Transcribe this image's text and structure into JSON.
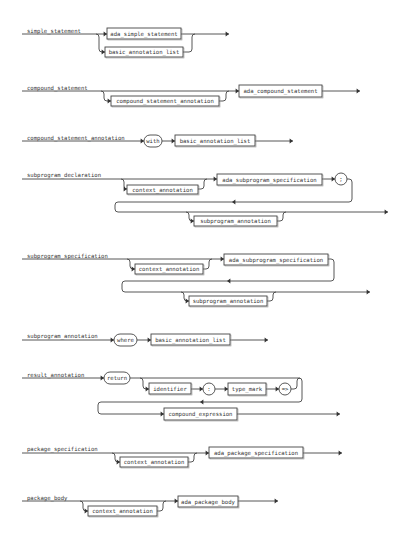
{
  "diagrams": [
    {
      "name": "simple_statement",
      "label": {
        "text": "simple_statement",
        "x": 27,
        "y": 29
      },
      "lines": [
        "M22,34 L96,34",
        "M96,34 L107,34",
        "M96,34 Q99,34 99,37 L99,49 Q99,52 102,52 L105,52",
        "M181,34 L229,34",
        "M183,52 L189,52 Q192,52 192,49 L192,37 Q192,34 195,34"
      ],
      "arrows": [
        {
          "x": 107,
          "y": 34,
          "dir": "right"
        },
        {
          "x": 105,
          "y": 52,
          "dir": "right"
        },
        {
          "x": 229,
          "y": 34,
          "dir": "right"
        }
      ],
      "nodes": [
        {
          "type": "box",
          "text": "ada_simple_statement",
          "x": 107,
          "y": 28,
          "w": 74,
          "h": 11
        },
        {
          "type": "box",
          "text": "basic_annotation_list",
          "x": 105,
          "y": 47,
          "w": 78,
          "h": 10
        }
      ]
    },
    {
      "name": "compound_statement",
      "label": {
        "text": "compound_statement",
        "x": 27,
        "y": 86
      },
      "lines": [
        "M22,91 L239,91",
        "M101,91 Q104,91 104,94 L104,98 Q104,101 107,101 L111,101",
        "M219,101 L223,101 Q226,101 226,98 L226,94 Q226,91 229,91",
        "M322,91 L360,91"
      ],
      "arrows": [
        {
          "x": 111,
          "y": 101,
          "dir": "right"
        },
        {
          "x": 239,
          "y": 91,
          "dir": "right"
        },
        {
          "x": 360,
          "y": 91,
          "dir": "right"
        }
      ],
      "nodes": [
        {
          "type": "box",
          "text": "compound_statement_annotation",
          "x": 111,
          "y": 96,
          "w": 108,
          "h": 10
        },
        {
          "type": "box",
          "text": "ada_compound_statement",
          "x": 239,
          "y": 85,
          "w": 83,
          "h": 12
        }
      ]
    },
    {
      "name": "compound_statement_annotation",
      "label": {
        "text": "compound_statement_annotation",
        "x": 27,
        "y": 136
      },
      "lines": [
        "M22,141 L144,141",
        "M162,141 L175,141",
        "M255,141 L293,141"
      ],
      "arrows": [
        {
          "x": 144,
          "y": 141,
          "dir": "right"
        },
        {
          "x": 175,
          "y": 141,
          "dir": "right"
        },
        {
          "x": 293,
          "y": 141,
          "dir": "right"
        }
      ],
      "nodes": [
        {
          "type": "pill",
          "text": "with",
          "x": 144,
          "y": 135,
          "w": 18,
          "h": 12
        },
        {
          "type": "box",
          "text": "basic_annotation_list",
          "x": 175,
          "y": 135,
          "w": 80,
          "h": 11
        }
      ]
    },
    {
      "name": "subprogram_declaration",
      "label": {
        "text": "subprogram_declaration",
        "x": 27,
        "y": 173
      },
      "lines": [
        "M22,179 L217,179",
        "M121,179 Q124,179 124,182 L124,186 Q124,189 127,189",
        "M198,189 L201,189 Q204,189 204,186 L204,182 Q204,179 207,179",
        "M322,179 L335,179",
        "M347,179 L349,179 Q352,179 352,182 L352,199 Q352,202 349,202 L118,202 Q115,202 115,205 L115,209 Q115,212 118,212 L388,212",
        "M186,212 Q189,212 189,215 L189,218 Q189,221 192,221 L194,221",
        "M277,221 L280,221 Q283,221 283,218 L283,215 Q283,212 286,212"
      ],
      "arrows": [
        {
          "x": 127,
          "y": 189,
          "dir": "right"
        },
        {
          "x": 217,
          "y": 179,
          "dir": "right"
        },
        {
          "x": 335,
          "y": 179,
          "dir": "right"
        },
        {
          "x": 232,
          "y": 202,
          "dir": "left"
        },
        {
          "x": 194,
          "y": 221,
          "dir": "right"
        },
        {
          "x": 388,
          "y": 212,
          "dir": "right"
        }
      ],
      "nodes": [
        {
          "type": "box",
          "text": "context_annotation",
          "x": 127,
          "y": 185,
          "w": 71,
          "h": 9
        },
        {
          "type": "box",
          "text": "ada_subprogram_specification",
          "x": 217,
          "y": 174,
          "w": 105,
          "h": 11
        },
        {
          "type": "circle",
          "text": ";",
          "x": 341,
          "y": 179,
          "r": 6
        },
        {
          "type": "box",
          "text": "subprogram_annotation",
          "x": 194,
          "y": 216,
          "w": 83,
          "h": 10
        }
      ]
    },
    {
      "name": "subprogram_specification",
      "label": {
        "text": "subprogram_specification",
        "x": 27,
        "y": 254
      },
      "lines": [
        "M22,259 L224,259",
        "M127,259 Q130,259 130,262 L130,266 Q130,269 133,269 L135,269",
        "M203,269 L206,269 Q209,269 209,266 L209,262 Q209,259 212,259",
        "M328,259 L331,259 Q334,259 334,262 L334,278 Q334,281 331,281 L125,281 Q122,281 122,284 L122,289 Q122,292 125,292 L370,292",
        "M181,292 Q184,292 184,295 L184,298 Q184,301 187,301 L189,301",
        "M267,301 L270,301 Q273,301 273,298 L273,295 Q273,292 276,292"
      ],
      "arrows": [
        {
          "x": 135,
          "y": 269,
          "dir": "right"
        },
        {
          "x": 224,
          "y": 259,
          "dir": "right"
        },
        {
          "x": 227,
          "y": 281,
          "dir": "left"
        },
        {
          "x": 189,
          "y": 301,
          "dir": "right"
        },
        {
          "x": 370,
          "y": 292,
          "dir": "right"
        }
      ],
      "nodes": [
        {
          "type": "box",
          "text": "context_annotation",
          "x": 135,
          "y": 264,
          "w": 68,
          "h": 10
        },
        {
          "type": "box",
          "text": "ada_subprogram_specification",
          "x": 224,
          "y": 254,
          "w": 104,
          "h": 11
        },
        {
          "type": "box",
          "text": "subprogram_annotation",
          "x": 189,
          "y": 296,
          "w": 78,
          "h": 10
        }
      ]
    },
    {
      "name": "subprogram_annotation",
      "label": {
        "text": "subprogram_annotation",
        "x": 27,
        "y": 334
      },
      "lines": [
        "M22,340 L114,340",
        "M137,340 L151,340",
        "M230,340 L268,340"
      ],
      "arrows": [
        {
          "x": 114,
          "y": 340,
          "dir": "right"
        },
        {
          "x": 151,
          "y": 340,
          "dir": "right"
        },
        {
          "x": 268,
          "y": 340,
          "dir": "right"
        }
      ],
      "nodes": [
        {
          "type": "pill",
          "text": "where",
          "x": 114,
          "y": 334,
          "w": 23,
          "h": 12
        },
        {
          "type": "box",
          "text": "basic_annotation_list",
          "x": 151,
          "y": 334,
          "w": 79,
          "h": 11
        }
      ]
    },
    {
      "name": "result_annotation",
      "label": {
        "text": "result_annotation",
        "x": 27,
        "y": 373
      },
      "lines": [
        "M22,378 L104,378",
        "M130,378 L299,378 Q302,378 302,381 L302,399 Q302,402 299,402 L101,402 Q98,402 98,405 L98,411 Q98,414 101,414 L340,414",
        "M140,378 Q143,378 143,381 L143,386 Q143,389 146,389 L149,389",
        "M191,389 L203,389",
        "M215,389 L228,389",
        "M266,389 L279,389",
        "M291,389 L294,389 Q297,389 297,386 L297,381 Q297,378 300,378"
      ],
      "arrows": [
        {
          "x": 104,
          "y": 378,
          "dir": "right"
        },
        {
          "x": 149,
          "y": 389,
          "dir": "right"
        },
        {
          "x": 203,
          "y": 389,
          "dir": "right"
        },
        {
          "x": 228,
          "y": 389,
          "dir": "right"
        },
        {
          "x": 279,
          "y": 389,
          "dir": "right"
        },
        {
          "x": 200,
          "y": 402,
          "dir": "left"
        },
        {
          "x": 164,
          "y": 414,
          "dir": "right"
        },
        {
          "x": 340,
          "y": 414,
          "dir": "right"
        }
      ],
      "nodes": [
        {
          "type": "pill",
          "text": "return",
          "x": 104,
          "y": 372,
          "w": 26,
          "h": 12
        },
        {
          "type": "box",
          "text": "identifier",
          "x": 149,
          "y": 383,
          "w": 42,
          "h": 11
        },
        {
          "type": "circle",
          "text": ":",
          "x": 209,
          "y": 389,
          "r": 6
        },
        {
          "type": "box",
          "text": "type_mark",
          "x": 228,
          "y": 383,
          "w": 38,
          "h": 12
        },
        {
          "type": "circle",
          "text": "=>",
          "x": 285,
          "y": 389,
          "r": 6
        },
        {
          "type": "box",
          "text": "compound_expression",
          "x": 164,
          "y": 408,
          "w": 73,
          "h": 12
        }
      ]
    },
    {
      "name": "package_specification",
      "label": {
        "text": "package_specification",
        "x": 27,
        "y": 447
      },
      "lines": [
        "M22,453 L209,453",
        "M112,453 Q115,453 115,456 L115,459 Q115,462 118,462 L120,462",
        "M188,462 L191,462 Q194,462 194,459 L194,456 Q194,453 197,453",
        "M303,453 L342,453"
      ],
      "arrows": [
        {
          "x": 120,
          "y": 462,
          "dir": "right"
        },
        {
          "x": 209,
          "y": 453,
          "dir": "right"
        },
        {
          "x": 342,
          "y": 453,
          "dir": "right"
        }
      ],
      "nodes": [
        {
          "type": "box",
          "text": "context_annotation",
          "x": 120,
          "y": 457,
          "w": 68,
          "h": 10
        },
        {
          "type": "box",
          "text": "ada_package_specification",
          "x": 209,
          "y": 447,
          "w": 94,
          "h": 11
        }
      ]
    },
    {
      "name": "package_body",
      "label": {
        "text": "package_body",
        "x": 27,
        "y": 496
      },
      "lines": [
        "M22,501 L178,501",
        "M80,501 Q83,501 83,504 L83,508 Q83,511 86,511 L88,511",
        "M157,511 L160,511 Q163,511 163,508 L163,504 Q163,501 166,501",
        "M238,501 L278,501"
      ],
      "arrows": [
        {
          "x": 88,
          "y": 511,
          "dir": "right"
        },
        {
          "x": 178,
          "y": 501,
          "dir": "right"
        },
        {
          "x": 278,
          "y": 501,
          "dir": "right"
        }
      ],
      "nodes": [
        {
          "type": "box",
          "text": "context_annotation",
          "x": 88,
          "y": 506,
          "w": 69,
          "h": 10
        },
        {
          "type": "box",
          "text": "ada_package_body",
          "x": 178,
          "y": 496,
          "w": 60,
          "h": 11
        }
      ]
    }
  ],
  "colors": {
    "line": "#444444",
    "text": "#333333",
    "background": "#ffffff"
  }
}
